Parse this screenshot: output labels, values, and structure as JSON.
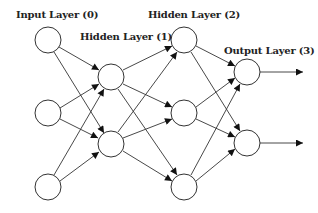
{
  "diagram": {
    "labels": {
      "input": "Input Layer (0)",
      "hidden1": "Hidden Layer (1)",
      "hidden2": "Hidden Layer (2)",
      "output": "Output Layer (3)"
    },
    "layers": [
      {
        "name": "Input Layer (0)",
        "nodes": 3
      },
      {
        "name": "Hidden Layer (1)",
        "nodes": 2
      },
      {
        "name": "Hidden Layer (2)",
        "nodes": 3
      },
      {
        "name": "Output Layer (3)",
        "nodes": 2
      }
    ],
    "connections": "fully connected between consecutive layers",
    "outputs": 2
  }
}
